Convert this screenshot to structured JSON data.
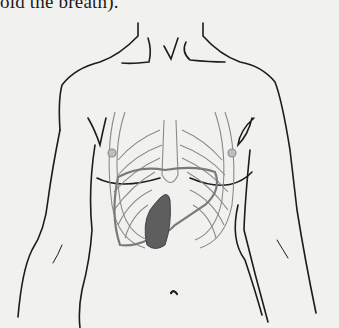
{
  "page": {
    "caption_fragment": "old the breath).",
    "figure": {
      "subject": "anterior torso outline with rib cage, liver outline and shaded spleen",
      "colors": {
        "background": "#f1f1ef",
        "outline": "#1c1c1c",
        "ribs": "#8a8a8a",
        "liver_outline": "#7a7a7a",
        "spleen_fill": "#5e5e5e"
      }
    }
  }
}
